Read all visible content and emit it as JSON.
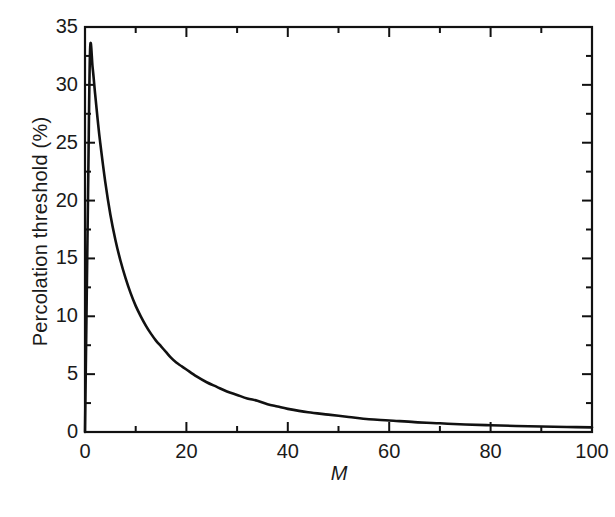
{
  "figure": {
    "background_color": "#ffffff",
    "line_color": "#111111",
    "axis_color": "#111111",
    "caption_fragment": ""
  },
  "chart_data": {
    "type": "line",
    "title": "",
    "xlabel": "M",
    "ylabel": "Percolation threshold (%)",
    "xlim": [
      0,
      100
    ],
    "ylim": [
      0,
      35
    ],
    "grid": false,
    "legend": null,
    "x_major_ticks": [
      0,
      20,
      40,
      60,
      80,
      100
    ],
    "x_minor_ticks": [
      10,
      30,
      50,
      70,
      90
    ],
    "x_tick_labels": [
      "0",
      "20",
      "40",
      "60",
      "80",
      "100"
    ],
    "y_major_ticks": [
      0,
      5,
      10,
      15,
      20,
      25,
      30,
      35
    ],
    "y_minor_ticks": [
      2.5,
      7.5,
      12.5,
      17.5,
      22.5,
      27.5,
      32.5
    ],
    "y_tick_labels": [
      "0",
      "5",
      "10",
      "15",
      "20",
      "25",
      "30",
      "35"
    ],
    "series": [
      {
        "name": "Percolation threshold",
        "x": [
          0,
          0.6,
          1,
          1.5,
          2,
          2.5,
          3,
          4,
          5,
          6,
          7,
          8,
          9,
          10,
          11,
          12,
          13,
          14,
          15,
          16,
          17,
          18,
          19,
          20,
          22,
          24,
          26,
          28,
          30,
          32,
          34,
          36,
          38,
          40,
          44,
          48,
          52,
          56,
          60,
          65,
          70,
          75,
          80,
          85,
          90,
          95,
          100
        ],
        "y": [
          0,
          20.5,
          33.0,
          31.5,
          29.2,
          27.0,
          25.0,
          21.6,
          18.8,
          16.6,
          14.8,
          13.3,
          12.0,
          10.9,
          10.0,
          9.2,
          8.5,
          7.9,
          7.4,
          6.9,
          6.4,
          6.0,
          5.7,
          5.4,
          4.8,
          4.3,
          3.9,
          3.5,
          3.2,
          2.9,
          2.7,
          2.4,
          2.2,
          2.0,
          1.7,
          1.5,
          1.3,
          1.1,
          1.0,
          0.85,
          0.75,
          0.65,
          0.58,
          0.52,
          0.47,
          0.43,
          0.4
        ]
      }
    ]
  }
}
